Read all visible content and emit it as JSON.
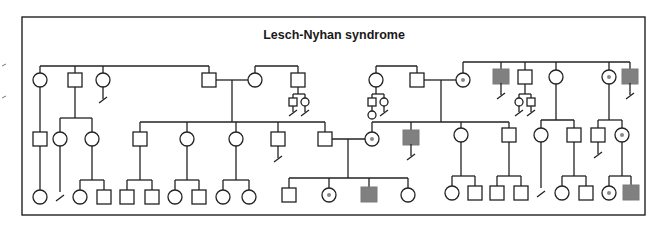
{
  "title": "Lesch-Nyhan syndrome",
  "colors": {
    "line": "#222222",
    "affected_fill": "#808080",
    "carrier_dot": "#888888",
    "background": "#ffffff"
  },
  "legend_semantics": {
    "square": "male",
    "circle": "female",
    "filled_square": "affected male",
    "dotted_circle": "carrier female",
    "slash_line": "no offspring / line of descent terminated"
  },
  "frame": {
    "x1": 22,
    "y1": 17,
    "x2": 645,
    "y2": 215
  },
  "margin_ticks": [
    {
      "x": 2,
      "y": 66
    },
    {
      "x": 2,
      "y": 98
    }
  ],
  "generations": {
    "I": {
      "symbols": [
        {
          "id": "I-1",
          "type": "female",
          "x": 40,
          "y": 80
        },
        {
          "id": "I-2",
          "type": "male",
          "x": 75,
          "y": 80
        },
        {
          "id": "I-3",
          "type": "female",
          "x": 103,
          "y": 80,
          "no_offspring": true
        },
        {
          "id": "I-4",
          "type": "male",
          "x": 209,
          "y": 80
        },
        {
          "id": "I-5",
          "type": "female",
          "x": 255,
          "y": 80
        },
        {
          "id": "I-6",
          "type": "male",
          "x": 298,
          "y": 80
        },
        {
          "id": "I-6a",
          "type": "male",
          "x": 293,
          "y": 102,
          "small": true,
          "no_offspring": true
        },
        {
          "id": "I-6b",
          "type": "female",
          "x": 305,
          "y": 102,
          "small": true,
          "no_offspring": true
        },
        {
          "id": "I-7",
          "type": "female",
          "x": 376,
          "y": 80
        },
        {
          "id": "I-7a",
          "type": "male",
          "x": 372,
          "y": 102,
          "small": true
        },
        {
          "id": "I-7b",
          "type": "female",
          "x": 384,
          "y": 102,
          "small": true,
          "no_offspring": true
        },
        {
          "id": "I-7c",
          "type": "female",
          "x": 372,
          "y": 115,
          "small": true
        },
        {
          "id": "I-8",
          "type": "male",
          "x": 417,
          "y": 80
        },
        {
          "id": "I-9",
          "type": "carrier_female",
          "x": 463,
          "y": 80
        },
        {
          "id": "I-10",
          "type": "affected_male",
          "x": 501,
          "y": 76,
          "no_offspring": true
        },
        {
          "id": "I-11",
          "type": "male",
          "x": 525,
          "y": 77
        },
        {
          "id": "I-11a",
          "type": "female",
          "x": 519,
          "y": 102,
          "small": true,
          "no_offspring": true
        },
        {
          "id": "I-11b",
          "type": "male",
          "x": 531,
          "y": 102,
          "small": true,
          "no_offspring": true
        },
        {
          "id": "I-12",
          "type": "female",
          "x": 556,
          "y": 77
        },
        {
          "id": "I-13",
          "type": "carrier_female",
          "x": 609,
          "y": 77
        },
        {
          "id": "I-14",
          "type": "affected_male",
          "x": 630,
          "y": 76,
          "no_offspring": true
        }
      ]
    },
    "II": {
      "symbols": [
        {
          "id": "II-1",
          "type": "male",
          "x": 40,
          "y": 139
        },
        {
          "id": "II-2",
          "type": "female",
          "x": 60,
          "y": 139
        },
        {
          "id": "II-3",
          "type": "female",
          "x": 92,
          "y": 139
        },
        {
          "id": "II-4",
          "type": "male",
          "x": 140,
          "y": 139
        },
        {
          "id": "II-5",
          "type": "female",
          "x": 187,
          "y": 139
        },
        {
          "id": "II-6",
          "type": "female",
          "x": 236,
          "y": 139
        },
        {
          "id": "II-7",
          "type": "male",
          "x": 278,
          "y": 139,
          "no_offspring": true
        },
        {
          "id": "II-8",
          "type": "male",
          "x": 325,
          "y": 139
        },
        {
          "id": "II-9",
          "type": "carrier_female",
          "x": 372,
          "y": 139
        },
        {
          "id": "II-10",
          "type": "affected_male",
          "x": 411,
          "y": 137,
          "no_offspring": true
        },
        {
          "id": "II-11",
          "type": "female",
          "x": 461,
          "y": 135
        },
        {
          "id": "II-12",
          "type": "male",
          "x": 509,
          "y": 135
        },
        {
          "id": "II-13",
          "type": "female",
          "x": 541,
          "y": 135
        },
        {
          "id": "II-14",
          "type": "male",
          "x": 574,
          "y": 135
        },
        {
          "id": "II-15",
          "type": "male",
          "x": 598,
          "y": 135,
          "no_offspring": true
        },
        {
          "id": "II-16",
          "type": "carrier_female",
          "x": 622,
          "y": 135
        }
      ]
    },
    "III": {
      "symbols": [
        {
          "id": "III-1",
          "type": "female",
          "x": 40,
          "y": 197
        },
        {
          "id": "III-2",
          "type": "slash",
          "x": 60,
          "y": 197
        },
        {
          "id": "III-3",
          "type": "female",
          "x": 80,
          "y": 197
        },
        {
          "id": "III-4",
          "type": "male",
          "x": 104,
          "y": 197
        },
        {
          "id": "III-5",
          "type": "male",
          "x": 127,
          "y": 197
        },
        {
          "id": "III-6",
          "type": "male",
          "x": 152,
          "y": 197
        },
        {
          "id": "III-7",
          "type": "female",
          "x": 175,
          "y": 197
        },
        {
          "id": "III-8",
          "type": "male",
          "x": 199,
          "y": 197
        },
        {
          "id": "III-9",
          "type": "female",
          "x": 223,
          "y": 197
        },
        {
          "id": "III-10",
          "type": "female",
          "x": 249,
          "y": 197
        },
        {
          "id": "III-11",
          "type": "male",
          "x": 289,
          "y": 195
        },
        {
          "id": "III-12",
          "type": "carrier_female",
          "x": 329,
          "y": 195
        },
        {
          "id": "III-13",
          "type": "affected_male",
          "x": 369,
          "y": 194
        },
        {
          "id": "III-14",
          "type": "female",
          "x": 408,
          "y": 195
        },
        {
          "id": "III-15",
          "type": "female",
          "x": 452,
          "y": 193
        },
        {
          "id": "III-16",
          "type": "male",
          "x": 475,
          "y": 193
        },
        {
          "id": "III-17",
          "type": "male",
          "x": 497,
          "y": 193
        },
        {
          "id": "III-18",
          "type": "male",
          "x": 521,
          "y": 193
        },
        {
          "id": "III-19",
          "type": "slash",
          "x": 541,
          "y": 193
        },
        {
          "id": "III-20",
          "type": "female",
          "x": 562,
          "y": 193
        },
        {
          "id": "III-21",
          "type": "male",
          "x": 586,
          "y": 193
        },
        {
          "id": "III-22",
          "type": "carrier_female",
          "x": 609,
          "y": 193
        },
        {
          "id": "III-23",
          "type": "affected_male",
          "x": 631,
          "y": 192
        }
      ]
    }
  },
  "lines": [
    [
      40,
      66,
      209,
      66
    ],
    [
      40,
      66,
      40,
      73
    ],
    [
      75,
      66,
      75,
      73
    ],
    [
      103,
      66,
      103,
      73
    ],
    [
      209,
      66,
      209,
      73
    ],
    [
      216,
      80,
      248,
      80
    ],
    [
      232,
      80,
      232,
      122
    ],
    [
      255,
      73,
      255,
      66
    ],
    [
      255,
      66,
      298,
      66
    ],
    [
      298,
      66,
      298,
      73
    ],
    [
      298,
      87,
      298,
      94
    ],
    [
      293,
      94,
      305,
      94
    ],
    [
      293,
      94,
      293,
      99
    ],
    [
      305,
      94,
      305,
      98
    ],
    [
      376,
      73,
      376,
      66
    ],
    [
      376,
      66,
      417,
      66
    ],
    [
      417,
      66,
      417,
      73
    ],
    [
      376,
      87,
      376,
      94
    ],
    [
      372,
      94,
      384,
      94
    ],
    [
      372,
      94,
      372,
      99
    ],
    [
      384,
      94,
      384,
      98
    ],
    [
      372,
      105,
      372,
      111
    ],
    [
      424,
      80,
      456,
      80
    ],
    [
      441,
      80,
      441,
      122
    ],
    [
      463,
      73,
      463,
      62
    ],
    [
      463,
      62,
      630,
      62
    ],
    [
      501,
      62,
      501,
      69
    ],
    [
      525,
      62,
      525,
      70
    ],
    [
      556,
      62,
      556,
      70
    ],
    [
      609,
      62,
      609,
      70
    ],
    [
      630,
      62,
      630,
      69
    ],
    [
      525,
      84,
      525,
      94
    ],
    [
      519,
      94,
      531,
      94
    ],
    [
      519,
      94,
      519,
      98
    ],
    [
      531,
      94,
      531,
      99
    ],
    [
      40,
      87,
      40,
      132
    ],
    [
      75,
      87,
      75,
      118
    ],
    [
      60,
      118,
      92,
      118
    ],
    [
      60,
      118,
      60,
      132
    ],
    [
      92,
      118,
      92,
      132
    ],
    [
      140,
      122,
      325,
      122
    ],
    [
      140,
      122,
      140,
      132
    ],
    [
      187,
      122,
      187,
      132
    ],
    [
      236,
      122,
      236,
      132
    ],
    [
      278,
      122,
      278,
      132
    ],
    [
      325,
      122,
      325,
      132
    ],
    [
      332,
      139,
      365,
      139
    ],
    [
      348,
      139,
      348,
      178
    ],
    [
      372,
      132,
      372,
      122
    ],
    [
      372,
      122,
      509,
      122
    ],
    [
      411,
      122,
      411,
      130
    ],
    [
      461,
      122,
      461,
      128
    ],
    [
      509,
      122,
      509,
      128
    ],
    [
      556,
      84,
      556,
      120
    ],
    [
      541,
      120,
      574,
      120
    ],
    [
      541,
      120,
      541,
      128
    ],
    [
      574,
      120,
      574,
      128
    ],
    [
      609,
      84,
      609,
      120
    ],
    [
      598,
      120,
      622,
      120
    ],
    [
      598,
      120,
      598,
      128
    ],
    [
      622,
      120,
      622,
      128
    ],
    [
      40,
      146,
      40,
      190
    ],
    [
      60,
      146,
      60,
      192
    ],
    [
      92,
      146,
      92,
      180
    ],
    [
      80,
      180,
      104,
      180
    ],
    [
      80,
      180,
      80,
      190
    ],
    [
      104,
      180,
      104,
      190
    ],
    [
      140,
      146,
      140,
      180
    ],
    [
      127,
      180,
      152,
      180
    ],
    [
      127,
      180,
      127,
      190
    ],
    [
      152,
      180,
      152,
      190
    ],
    [
      187,
      146,
      187,
      180
    ],
    [
      175,
      180,
      199,
      180
    ],
    [
      175,
      180,
      175,
      190
    ],
    [
      199,
      180,
      199,
      190
    ],
    [
      236,
      146,
      236,
      180
    ],
    [
      223,
      180,
      249,
      180
    ],
    [
      223,
      180,
      223,
      190
    ],
    [
      249,
      180,
      249,
      190
    ],
    [
      289,
      178,
      408,
      178
    ],
    [
      289,
      178,
      289,
      188
    ],
    [
      329,
      178,
      329,
      188
    ],
    [
      369,
      178,
      369,
      187
    ],
    [
      408,
      178,
      408,
      188
    ],
    [
      461,
      142,
      461,
      176
    ],
    [
      452,
      176,
      475,
      176
    ],
    [
      452,
      176,
      452,
      186
    ],
    [
      475,
      176,
      475,
      186
    ],
    [
      509,
      142,
      509,
      176
    ],
    [
      497,
      176,
      521,
      176
    ],
    [
      497,
      176,
      497,
      186
    ],
    [
      521,
      176,
      521,
      186
    ],
    [
      541,
      142,
      541,
      188
    ],
    [
      574,
      142,
      574,
      176
    ],
    [
      562,
      176,
      586,
      176
    ],
    [
      562,
      176,
      562,
      186
    ],
    [
      586,
      176,
      586,
      186
    ],
    [
      622,
      142,
      622,
      176
    ],
    [
      609,
      176,
      631,
      176
    ],
    [
      609,
      176,
      609,
      186
    ],
    [
      631,
      176,
      631,
      185
    ]
  ]
}
